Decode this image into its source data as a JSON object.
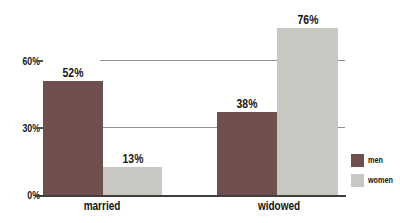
{
  "chart_data": {
    "type": "bar",
    "title": "",
    "xlabel": "",
    "ylabel": "",
    "categories": [
      "married",
      "widowed"
    ],
    "series": [
      {
        "name": "men",
        "color": "#6f504f",
        "values": [
          52,
          38
        ],
        "labels": [
          "52%",
          "38%"
        ]
      },
      {
        "name": "women",
        "color": "#c9c7c2",
        "values": [
          13,
          76
        ],
        "labels": [
          "13%",
          "76%"
        ]
      }
    ],
    "ylim": [
      0,
      80
    ],
    "y_ticks": [
      {
        "value": 0,
        "label": "0%"
      },
      {
        "value": 30,
        "label": "30%"
      },
      {
        "value": 60,
        "label": "60%"
      }
    ],
    "grid": "horizontal",
    "legend": {
      "position": "right",
      "entries": [
        {
          "label": "men",
          "color": "#6f504f"
        },
        {
          "label": "women",
          "color": "#c9c7c2"
        }
      ]
    },
    "colors": {
      "text": "#151515",
      "gridline": "#8f8f8f",
      "axis": "#3f3f3f",
      "background": "#ffffff"
    }
  }
}
